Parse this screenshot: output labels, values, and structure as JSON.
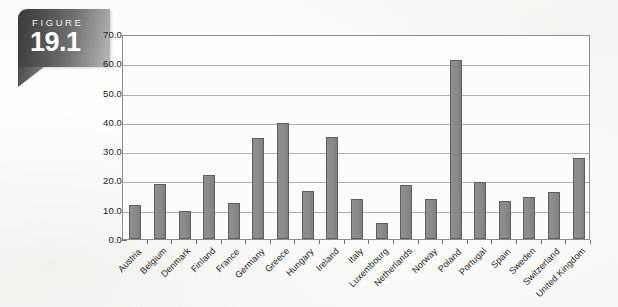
{
  "figure": {
    "label": "FIGURE",
    "number": "19.1"
  },
  "chart_data": {
    "type": "bar",
    "title": "",
    "subtitle": "",
    "xlabel": "",
    "ylabel": "",
    "ylim": [
      0.0,
      70.0
    ],
    "ytick_step": 10.0,
    "ytick_labels": [
      "0.0",
      "10.0",
      "20.0",
      "30.0",
      "40.0",
      "50.0",
      "60.0",
      "70.0"
    ],
    "grid": true,
    "legend": "none",
    "bar_color": "#8a8a8a",
    "bar_outline_color": "#5e5e5e",
    "categories": [
      "Austria",
      "Belgium",
      "Denmark",
      "Finland",
      "France",
      "Germany",
      "Greece",
      "Hungary",
      "Ireland",
      "Italy",
      "Luxembourg",
      "Netherlands",
      "Norway",
      "Poland",
      "Portugal",
      "Spain",
      "Sweden",
      "Switzerland",
      "United Kingdom"
    ],
    "values": [
      11.5,
      18.7,
      9.7,
      22.0,
      12.3,
      34.5,
      39.6,
      16.5,
      35.0,
      13.5,
      5.5,
      18.3,
      13.5,
      61.0,
      19.5,
      13.0,
      14.2,
      16.0,
      27.6
    ]
  }
}
